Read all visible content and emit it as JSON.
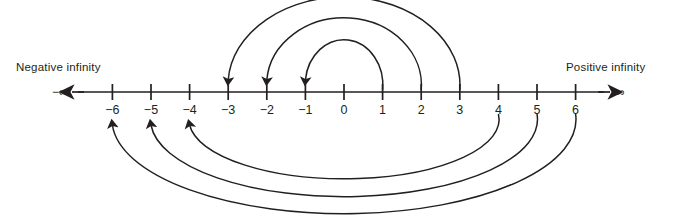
{
  "figure": {
    "kind": "number-line-diagram",
    "background_color": "#ffffff",
    "ink_color": "#231f20",
    "width": 682,
    "height": 216
  },
  "axis": {
    "left_end_label": "Negative infinity",
    "right_end_label": "Positive infinity",
    "left_symbol": "−∞",
    "right_symbol": "∞",
    "left_arrow_icon": "arrow-left-icon",
    "right_arrow_icon": "arrow-right-icon",
    "y": 92,
    "x_start": 72,
    "x_end": 610,
    "tick_spacing": 38.6,
    "origin_x": 344
  },
  "ticks": [
    {
      "value": -6,
      "label": "−6",
      "x": 112.4
    },
    {
      "value": -5,
      "label": "−5",
      "x": 151.0
    },
    {
      "value": -4,
      "label": "−4",
      "x": 189.6
    },
    {
      "value": -3,
      "label": "−3",
      "x": 228.2
    },
    {
      "value": -2,
      "label": "−2",
      "x": 266.8
    },
    {
      "value": -1,
      "label": "−1",
      "x": 305.4
    },
    {
      "value": 0,
      "label": "0",
      "x": 344.0
    },
    {
      "value": 1,
      "label": "1",
      "x": 382.6
    },
    {
      "value": 2,
      "label": "2",
      "x": 421.2
    },
    {
      "value": 3,
      "label": "3",
      "x": 459.8
    },
    {
      "value": 4,
      "label": "4",
      "x": 498.4
    },
    {
      "value": 5,
      "label": "5",
      "x": 537.0
    },
    {
      "value": 6,
      "label": "6",
      "x": 575.6
    }
  ],
  "arcs": {
    "description": "Each arc maps a number to its opposite; all arrowheads point toward the negative value.",
    "above": [
      {
        "from": 1,
        "to": -1,
        "from_x": 382.6,
        "to_x": 305.4,
        "apex_y": 47
      },
      {
        "from": 2,
        "to": -2,
        "from_x": 421.2,
        "to_x": 266.8,
        "apex_y": 25
      },
      {
        "from": 3,
        "to": -3,
        "from_x": 459.8,
        "to_x": 228.2,
        "apex_y": 4
      }
    ],
    "below": [
      {
        "from": 4,
        "to": -4,
        "from_x": 498.4,
        "to_x": 189.6,
        "nadir_y": 171
      },
      {
        "from": 5,
        "to": -5,
        "from_x": 537.0,
        "to_x": 151.0,
        "nadir_y": 189
      },
      {
        "from": 6,
        "to": -6,
        "from_x": 575.6,
        "to_x": 112.4,
        "nadir_y": 206
      }
    ]
  }
}
